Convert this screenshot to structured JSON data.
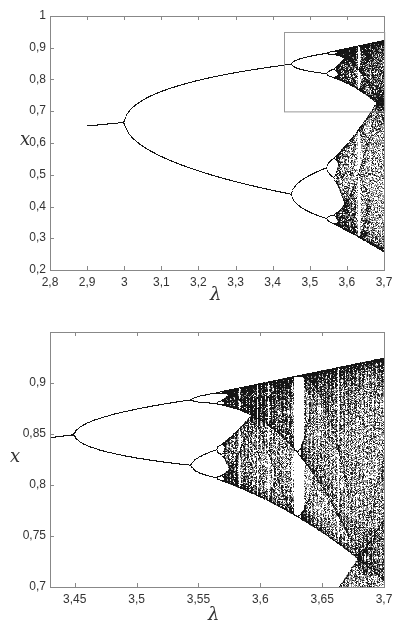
{
  "chart_data": [
    {
      "type": "scatter",
      "title": "",
      "description": "Bifurcation diagram of the logistic map x_{n+1} = λ x_n (1 - x_n)",
      "xlabel": "λ",
      "ylabel": "x",
      "xlim": [
        2.8,
        3.7
      ],
      "ylim": [
        0.2,
        1.0
      ],
      "xticks": [
        "2,8",
        "2,9",
        "3",
        "3,1",
        "3,2",
        "3,3",
        "3,4",
        "3,5",
        "3,6",
        "3,7"
      ],
      "xtick_values": [
        2.8,
        2.9,
        3.0,
        3.1,
        3.2,
        3.3,
        3.4,
        3.5,
        3.6,
        3.7
      ],
      "yticks": [
        "0,2",
        "0,3",
        "0,4",
        "0,5",
        "0,6",
        "0,7",
        "0,8",
        "0,9",
        "1"
      ],
      "ytick_values": [
        0.2,
        0.3,
        0.4,
        0.5,
        0.6,
        0.7,
        0.8,
        0.9,
        1.0
      ],
      "data_lambda_start": 2.9,
      "grid": false,
      "annotations": [
        {
          "type": "rectangle",
          "x0": 3.43,
          "x1": 3.7,
          "y0": 0.7,
          "y1": 0.95,
          "label": "zoom region"
        }
      ],
      "key_points": [
        {
          "lambda": 2.9,
          "x": 0.655
        },
        {
          "lambda": 3.0,
          "x": 0.667,
          "note": "period-2 bifurcation"
        },
        {
          "lambda": 3.449,
          "x": [
            0.85,
            0.44
          ],
          "note": "period-4 bifurcation"
        },
        {
          "lambda": 3.544,
          "note": "period-8 bifurcation"
        },
        {
          "lambda": 3.57,
          "note": "onset of chaos"
        },
        {
          "lambda": 3.63,
          "note": "period-6 window"
        },
        {
          "lambda": 3.7,
          "x_range": [
            0.25,
            0.925
          ]
        }
      ]
    },
    {
      "type": "scatter",
      "title": "",
      "description": "Zoomed bifurcation diagram",
      "xlabel": "λ",
      "ylabel": "x",
      "xlim": [
        3.43,
        3.7
      ],
      "ylim": [
        0.7,
        0.95
      ],
      "xticks": [
        "3,45",
        "3,5",
        "3,55",
        "3,6",
        "3,65",
        "3,7"
      ],
      "xtick_values": [
        3.45,
        3.5,
        3.55,
        3.6,
        3.65,
        3.7
      ],
      "yticks": [
        "0,7",
        "0,75",
        "0,8",
        "0,85",
        "0,9"
      ],
      "ytick_values": [
        0.7,
        0.75,
        0.8,
        0.85,
        0.9
      ],
      "data_lambda_start": 3.43,
      "grid": false,
      "key_points": [
        {
          "lambda": 3.449,
          "x": 0.85,
          "note": "period-4 bifurcation"
        },
        {
          "lambda": 3.544,
          "x": [
            0.884,
            0.819
          ],
          "note": "period-8 bifurcation"
        },
        {
          "lambda": 3.564,
          "note": "period-16 bifurcation"
        },
        {
          "lambda": 3.63,
          "note": "period-6 window"
        },
        {
          "lambda": 3.7,
          "x_max": 0.925
        }
      ]
    }
  ],
  "colors": {
    "axis": "#888888",
    "points": "#1a1a1a",
    "text": "#333333",
    "box": "#999999"
  },
  "layout": {
    "top": {
      "left": 50,
      "right": 384,
      "top": 16,
      "bottom": 270
    },
    "bottom": {
      "left": 50,
      "right": 384,
      "top": 12,
      "bottom": 267
    }
  }
}
